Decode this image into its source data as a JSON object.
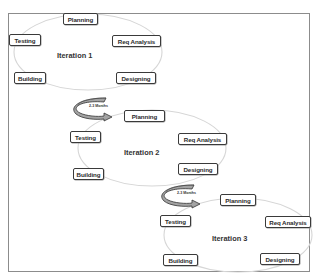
{
  "diagram": {
    "type": "iterative-development-cycles",
    "iterations": [
      {
        "label": "Iteration 1",
        "phases": [
          "Planning",
          "Req Analysis",
          "Designing",
          "Building",
          "Testing"
        ]
      },
      {
        "label": "Iteration 2",
        "phases": [
          "Planning",
          "Req Analysis",
          "Designing",
          "Building",
          "Testing"
        ]
      },
      {
        "label": "Iteration 3",
        "phases": [
          "Planning",
          "Req Analysis",
          "Designing",
          "Building",
          "Testing"
        ]
      }
    ],
    "transitions": [
      {
        "from": "Iteration 1",
        "to": "Iteration 2",
        "label": "2-3 Months"
      },
      {
        "from": "Iteration 2",
        "to": "Iteration 3",
        "label": "2-3 Months"
      }
    ],
    "colors": {
      "box_border": "#3a3a3a",
      "ellipse": "#d9d9d9",
      "frame": "#8c8c8c",
      "arrow_fill": "#9a9a9a",
      "arrow_stroke": "#3a3a3a"
    }
  }
}
